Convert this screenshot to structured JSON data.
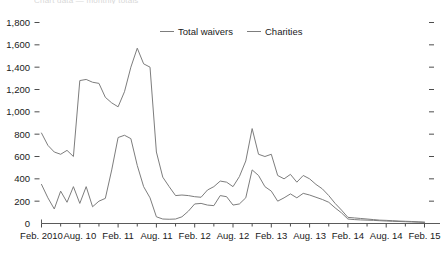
{
  "header": {
    "clipped_title": "Chart data — monthly totals"
  },
  "legend": {
    "position": "top-center",
    "entries": [
      {
        "label": "Total waivers",
        "color": "#7d7d7d"
      },
      {
        "label": "Charities",
        "color": "#7d7d7d"
      }
    ]
  },
  "chart_data": {
    "type": "line",
    "title": "",
    "subtitle": "",
    "xlabel": "",
    "ylabel": "",
    "ylim": [
      0,
      1800
    ],
    "ytick_step": 200,
    "grid": false,
    "legend_position": "top-center",
    "yticks": [
      "0",
      "200",
      "400",
      "600",
      "800",
      "1,000",
      "1,200",
      "1,400",
      "1,600",
      "1,800"
    ],
    "ytick_values": [
      0,
      200,
      400,
      600,
      800,
      1000,
      1200,
      1400,
      1600,
      1800
    ],
    "xticks": [
      "Feb. 2010",
      "Aug. 10",
      "Feb. 11",
      "Aug. 11",
      "Feb. 12",
      "Aug. 12",
      "Feb. 13",
      "Aug. 13",
      "Feb. 14",
      "Aug. 14",
      "Feb. 15"
    ],
    "xtick_indices": [
      0,
      6,
      12,
      18,
      24,
      30,
      36,
      42,
      48,
      54,
      60
    ],
    "x_count": 61,
    "series": [
      {
        "name": "Total waivers",
        "color": "#7d7d7d",
        "values": [
          810,
          700,
          640,
          620,
          655,
          600,
          1280,
          1290,
          1265,
          1255,
          1130,
          1080,
          1045,
          1180,
          1400,
          1570,
          1430,
          1400,
          640,
          415,
          330,
          250,
          255,
          250,
          240,
          235,
          300,
          330,
          380,
          370,
          330,
          420,
          560,
          850,
          620,
          600,
          620,
          430,
          400,
          440,
          370,
          430,
          400,
          350,
          310,
          250,
          180,
          120,
          55,
          50,
          45,
          40,
          35,
          30,
          28,
          25,
          22,
          20,
          18,
          15,
          12
        ]
      },
      {
        "name": "Charities",
        "color": "#7d7d7d",
        "values": [
          350,
          230,
          130,
          290,
          190,
          330,
          180,
          330,
          150,
          200,
          225,
          480,
          770,
          790,
          760,
          520,
          330,
          230,
          60,
          40,
          38,
          40,
          60,
          110,
          175,
          180,
          165,
          160,
          250,
          240,
          165,
          175,
          230,
          480,
          430,
          330,
          290,
          200,
          230,
          265,
          230,
          270,
          255,
          235,
          215,
          190,
          140,
          95,
          40,
          35,
          32,
          30,
          28,
          25,
          22,
          20,
          18,
          16,
          14,
          12,
          10
        ]
      }
    ]
  }
}
